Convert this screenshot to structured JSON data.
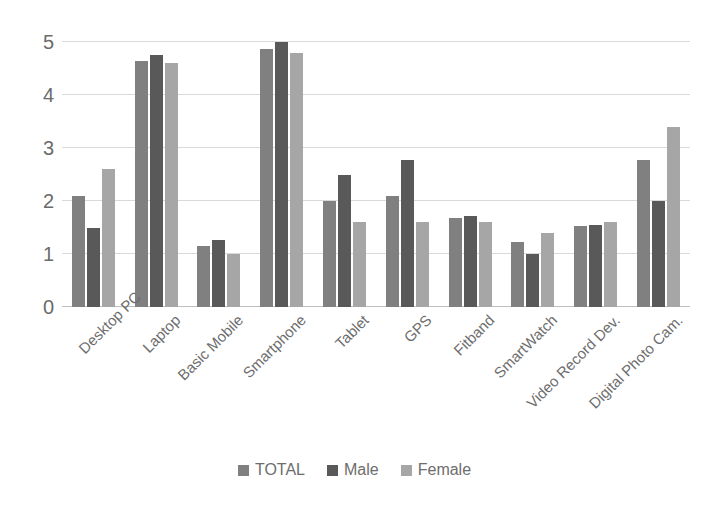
{
  "chart_data": {
    "type": "bar",
    "title": "",
    "subtitle": "",
    "xlabel": "",
    "ylabel": "",
    "ylim": [
      0,
      5
    ],
    "yticks": [
      0,
      1,
      2,
      3,
      4,
      5
    ],
    "ytick_labels": [
      "0",
      "1",
      "2",
      "3",
      "4",
      "5"
    ],
    "grid": true,
    "legend_position": "bottom",
    "categories": [
      "Desktop PC",
      "Laptop",
      "Basic Mobile",
      "Smartphone",
      "Tablet",
      "GPS",
      "Fitband",
      "SmartWatch",
      "Video Record Dev.",
      "Digital Photo Cam."
    ],
    "series": [
      {
        "name": "TOTAL",
        "color": "#808080",
        "values": [
          2.1,
          4.65,
          1.15,
          4.87,
          2.0,
          2.1,
          1.68,
          1.23,
          1.52,
          2.78
        ]
      },
      {
        "name": "Male",
        "color": "#595959",
        "values": [
          1.5,
          4.75,
          1.27,
          5.0,
          2.5,
          2.78,
          1.72,
          1.0,
          1.55,
          2.0
        ]
      },
      {
        "name": "Female",
        "color": "#a6a6a6",
        "values": [
          2.6,
          4.6,
          1.0,
          4.8,
          1.6,
          1.6,
          1.6,
          1.4,
          1.6,
          3.4
        ]
      }
    ]
  },
  "style": {
    "gridline_color": "#d9d9d9",
    "axis_color": "#bfbfbf",
    "tick_text_color": "#6b6b6b",
    "background": "#ffffff"
  }
}
